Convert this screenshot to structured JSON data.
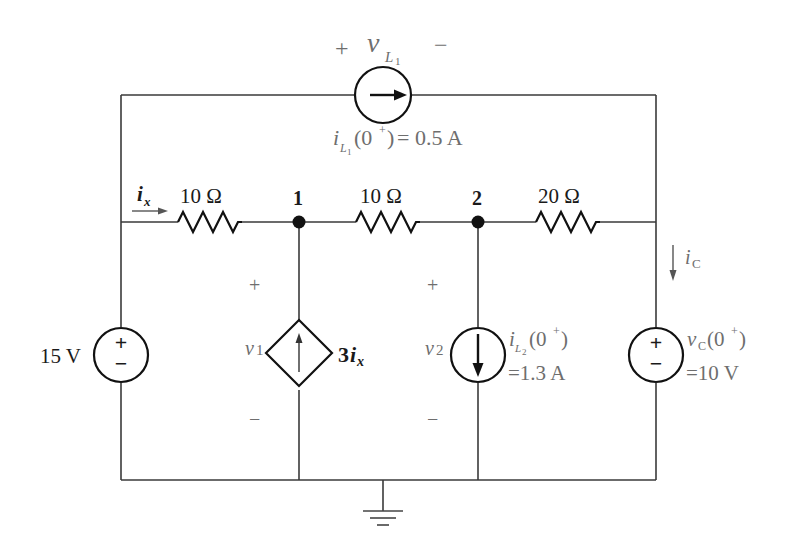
{
  "diagram": {
    "type": "circuit-schematic",
    "title": "",
    "colors": {
      "wire": "#3a3a3a",
      "component": "#111111",
      "label": "#1a1a1a",
      "annotation": "#6e6e6e",
      "background": "#ffffff"
    },
    "nodes": [
      {
        "id": "1",
        "label": "1"
      },
      {
        "id": "2",
        "label": "2"
      },
      {
        "id": "ground",
        "label": ""
      }
    ],
    "resistors": [
      {
        "id": "R1",
        "label": "10 Ω",
        "between": "left-top-node → node 1"
      },
      {
        "id": "R2",
        "label": "10 Ω",
        "between": "node 1 → node 2"
      },
      {
        "id": "R3",
        "label": "20 Ω",
        "between": "node 2 → right-top-node"
      }
    ],
    "sources": {
      "inductor_L1_current_source": {
        "voltage_label_var": "v",
        "voltage_label_sub": "L",
        "voltage_label_subsub": "1",
        "plus": "+",
        "minus": "−",
        "current_var": "i",
        "current_sub": "L",
        "current_subsub": "1",
        "current_arg": "(0",
        "current_sup": "+",
        "current_close": ")",
        "current_value": "= 0.5 A"
      },
      "voltage_source_15V": {
        "label": "15 V",
        "plus": "+",
        "minus": "−"
      },
      "dependent_current_source": {
        "gain": "3",
        "control_var": "i",
        "control_sub": "x",
        "voltage_var": "v",
        "voltage_sub": "1",
        "plus": "+",
        "minus": "−"
      },
      "inductor_L2_current_source": {
        "voltage_var": "v",
        "voltage_sub": "2",
        "plus": "+",
        "minus": "−",
        "current_var": "i",
        "current_sub": "L",
        "current_subsub": "2",
        "current_arg": "(0",
        "current_sup": "+",
        "current_close": ")",
        "current_value": "=1.3 A"
      },
      "capacitor_voltage_source": {
        "voltage_var": "v",
        "voltage_sub": "C",
        "voltage_arg": "(0",
        "voltage_sup": "+",
        "voltage_close": ")",
        "voltage_value": "=10 V",
        "plus": "+",
        "minus": "−"
      }
    },
    "currents": {
      "ix": {
        "var": "i",
        "sub": "x"
      },
      "iC": {
        "var": "i",
        "sub": "C"
      }
    }
  }
}
